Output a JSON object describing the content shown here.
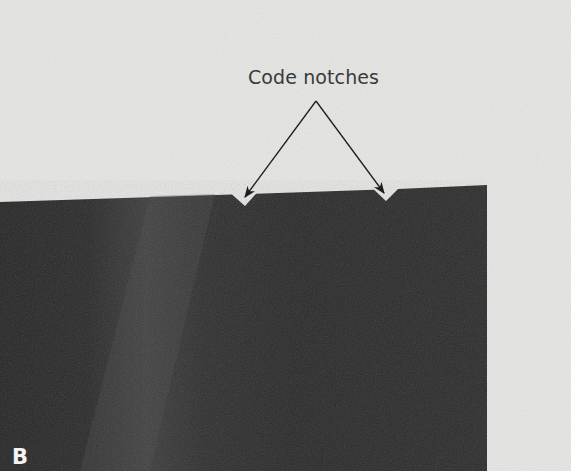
{
  "figure": {
    "panel_label": "B",
    "annotation": {
      "label": "Code notches",
      "arrow_count": 2
    },
    "colors": {
      "background": "#e6e6e4",
      "film": "#2b2b2b",
      "film_highlight": "#3e3e3e",
      "text": "#3a3a3a",
      "panel_label": "#f4f4f4"
    }
  }
}
